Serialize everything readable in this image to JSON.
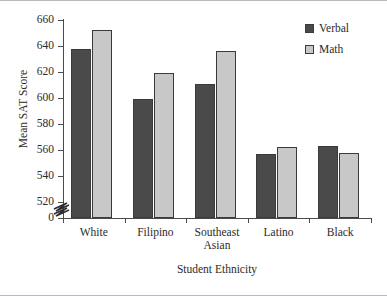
{
  "chart_data": {
    "type": "bar",
    "title": "",
    "xlabel": "Student Ethnicity",
    "ylabel": "Mean SAT Score",
    "categories": [
      "White",
      "Filipino",
      "Southeast Asian",
      "Latino",
      "Black"
    ],
    "category_lines": [
      [
        "White"
      ],
      [
        "Filipino"
      ],
      [
        "Southeast",
        "Asian"
      ],
      [
        "Latino"
      ],
      [
        "Black"
      ]
    ],
    "series": [
      {
        "name": "Verbal",
        "color": "#4a4a4a",
        "values": [
          638,
          599,
          611,
          557,
          563
        ]
      },
      {
        "name": "Math",
        "color": "#c8c8c8",
        "values": [
          652,
          619,
          636,
          562,
          558
        ]
      }
    ],
    "ylim": [
      520,
      660
    ],
    "yticks": [
      520,
      540,
      560,
      580,
      600,
      620,
      640,
      660
    ],
    "ytick_labels": [
      "520",
      "540",
      "560",
      "580",
      "600",
      "620",
      "640",
      "660"
    ],
    "zero_tick_label": "0",
    "axis_break": true,
    "axis_break_note": "zigzag break on y-axis between 0 and 520",
    "grid": false,
    "legend_position": "top-right",
    "legend_entries": [
      "Verbal",
      "Math"
    ]
  },
  "axes": {
    "y_title": "Mean SAT Score",
    "x_title": "Student Ethnicity"
  },
  "legend": {
    "items": [
      {
        "label": "Verbal"
      },
      {
        "label": "Math"
      }
    ]
  }
}
